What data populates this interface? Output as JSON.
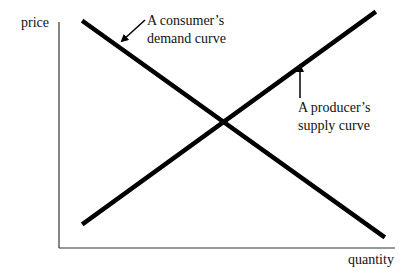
{
  "diagram": {
    "type": "supply-demand",
    "axes": {
      "y_label": "price",
      "x_label": "quantity"
    },
    "curves": [
      {
        "name": "demand",
        "slope": "downward",
        "label_line1": "A consumer’s",
        "label_line2": "demand curve"
      },
      {
        "name": "supply",
        "slope": "upward",
        "label_line1": "A producer’s",
        "label_line2": "supply curve"
      }
    ],
    "colors": {
      "line": "#000000",
      "axis": "#333333",
      "text": "#111111",
      "background": "#ffffff"
    }
  }
}
